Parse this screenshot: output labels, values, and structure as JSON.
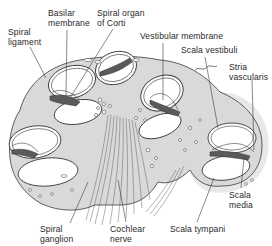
{
  "diagram": {
    "colors": {
      "bone_fill": "#d9d9d9",
      "halo": "#e6e6e6",
      "outline": "#3a3a3a",
      "organ_fill": "#5a5a5a",
      "chamber_fill": "#ffffff",
      "text": "#2a2a2a"
    },
    "labels": {
      "basilar_membrane": "Basilar\nmembrane",
      "spiral_organ_of_corti": "Spiral organ\nof Corti",
      "spiral_ligament": "Spiral\nligament",
      "vestibular_membrane": "Vestibular membrane",
      "scala_vestibuli": "Scala vestibuli",
      "stria_vascularis": "Stria\nvascularis",
      "scala_media": "Scala\nmedia",
      "spiral_ganglion": "Spiral\nganglion",
      "cochlear_nerve": "Cochlear\nnerve",
      "scala_tympani": "Scala tympani"
    }
  }
}
